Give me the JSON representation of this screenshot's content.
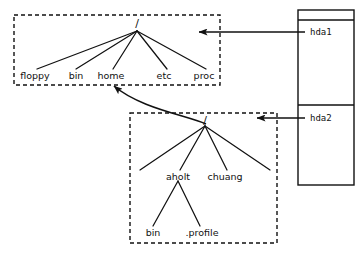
{
  "diagram": {
    "stroke_color": "#111111",
    "background_color": "#ffffff",
    "filesystems": [
      {
        "id": "hda1-tree",
        "box": {
          "x": 14,
          "y": 15,
          "width": 206,
          "height": 70,
          "style": "dashed"
        },
        "root": {
          "label": "/",
          "x": 137,
          "y": 25
        },
        "children": [
          {
            "label": "floppy",
            "x": 35,
            "y": 76
          },
          {
            "label": "bin",
            "x": 76,
            "y": 76
          },
          {
            "label": "home",
            "x": 111,
            "y": 76
          },
          {
            "label": "etc",
            "x": 164,
            "y": 76
          },
          {
            "label": "proc",
            "x": 204,
            "y": 76
          }
        ]
      },
      {
        "id": "hda2-tree",
        "box": {
          "x": 130,
          "y": 113,
          "width": 147,
          "height": 130,
          "style": "dashed"
        },
        "root": {
          "label": "/",
          "x": 205,
          "y": 122
        },
        "children": [
          {
            "label": "",
            "x": 140,
            "y": 170
          },
          {
            "label": "aholt",
            "x": 178,
            "y": 177
          },
          {
            "label": "chuang",
            "x": 225,
            "y": 177
          },
          {
            "label": "",
            "x": 270,
            "y": 170
          }
        ],
        "grandchildren": [
          {
            "label": "bin",
            "x": 153,
            "y": 233,
            "parent": "aholt"
          },
          {
            "label": ".profile",
            "x": 202,
            "y": 233,
            "parent": "aholt"
          }
        ]
      }
    ],
    "disk": {
      "box": {
        "x": 298,
        "y": 10,
        "width": 56,
        "height": 175,
        "style": "solid"
      },
      "dividers": [
        20,
        105
      ],
      "partitions": [
        {
          "label": "hda1",
          "x": 310,
          "y": 35
        },
        {
          "label": "hda2",
          "x": 310,
          "y": 121
        }
      ]
    },
    "arrows": [
      {
        "name": "hda1-mount-arrow",
        "from_x": 298,
        "from_y": 32,
        "to_x": 197,
        "to_y": 32,
        "type": "straight"
      },
      {
        "name": "hda2-mount-arrow",
        "from_x": 298,
        "from_y": 118,
        "to_x": 255,
        "to_y": 118,
        "type": "straight"
      },
      {
        "name": "mount-point-curve-arrow",
        "from_x": 206,
        "from_y": 124,
        "to_x": 111,
        "to_y": 84,
        "type": "curved"
      }
    ]
  }
}
